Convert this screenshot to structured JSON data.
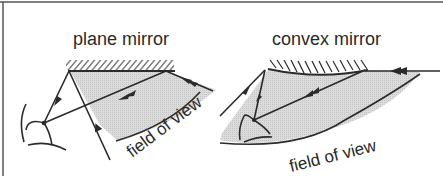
{
  "diagram": {
    "panels": [
      {
        "title": "plane mirror",
        "region_label": "field of view"
      },
      {
        "title": "convex mirror",
        "region_label": "field of view"
      }
    ],
    "colors": {
      "line": "#2b2b2b",
      "shade": "#d4d4d4",
      "border": "#555555",
      "background": "#ffffff"
    }
  }
}
